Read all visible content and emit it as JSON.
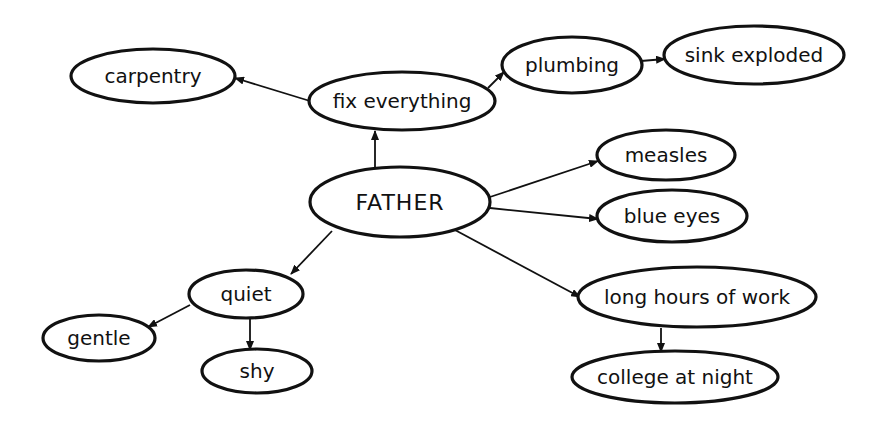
{
  "diagram": {
    "type": "concept-map",
    "style": "hand-drawn",
    "colors": {
      "ink": "#111111",
      "background": "#ffffff",
      "node_fill": "#ffffff"
    },
    "nodes": [
      {
        "id": "father",
        "label": "FATHER",
        "cx": 400,
        "cy": 202,
        "rx": 90,
        "ry": 35,
        "font_size": 22,
        "root": true
      },
      {
        "id": "fix_everything",
        "label": "fix everything",
        "cx": 402,
        "cy": 101,
        "rx": 93,
        "ry": 29,
        "font_size": 20
      },
      {
        "id": "carpentry",
        "label": "carpentry",
        "cx": 153,
        "cy": 76,
        "rx": 82,
        "ry": 27,
        "font_size": 20
      },
      {
        "id": "plumbing",
        "label": "plumbing",
        "cx": 572,
        "cy": 65,
        "rx": 70,
        "ry": 28,
        "font_size": 20
      },
      {
        "id": "sink_exploded",
        "label": "sink exploded",
        "cx": 754,
        "cy": 55,
        "rx": 90,
        "ry": 29,
        "font_size": 20
      },
      {
        "id": "measles",
        "label": "measles",
        "cx": 666,
        "cy": 155,
        "rx": 69,
        "ry": 25,
        "font_size": 20
      },
      {
        "id": "blue_eyes",
        "label": "blue eyes",
        "cx": 672,
        "cy": 216,
        "rx": 75,
        "ry": 26,
        "font_size": 20
      },
      {
        "id": "long_hours",
        "label": "long hours of work",
        "cx": 697,
        "cy": 297,
        "rx": 119,
        "ry": 30,
        "font_size": 20
      },
      {
        "id": "college",
        "label": "college at night",
        "cx": 675,
        "cy": 377,
        "rx": 103,
        "ry": 26,
        "font_size": 20
      },
      {
        "id": "quiet",
        "label": "quiet",
        "cx": 246,
        "cy": 294,
        "rx": 57,
        "ry": 24,
        "font_size": 20
      },
      {
        "id": "gentle",
        "label": "gentle",
        "cx": 99,
        "cy": 338,
        "rx": 56,
        "ry": 23,
        "font_size": 20
      },
      {
        "id": "shy",
        "label": "shy",
        "cx": 257,
        "cy": 371,
        "rx": 55,
        "ry": 22,
        "font_size": 20
      }
    ],
    "edges": [
      {
        "from": "father",
        "to": "fix_everything",
        "x1": 375,
        "y1": 167,
        "x2": 375,
        "y2": 131
      },
      {
        "from": "fix_everything",
        "to": "carpentry",
        "x1": 310,
        "y1": 101,
        "x2": 235,
        "y2": 78
      },
      {
        "from": "fix_everything",
        "to": "plumbing",
        "x1": 488,
        "y1": 88,
        "x2": 504,
        "y2": 72
      },
      {
        "from": "plumbing",
        "to": "sink_exploded",
        "x1": 641,
        "y1": 61,
        "x2": 665,
        "y2": 59
      },
      {
        "from": "father",
        "to": "measles",
        "x1": 490,
        "y1": 197,
        "x2": 598,
        "y2": 161
      },
      {
        "from": "father",
        "to": "blue_eyes",
        "x1": 490,
        "y1": 208,
        "x2": 598,
        "y2": 219
      },
      {
        "from": "father",
        "to": "long_hours",
        "x1": 455,
        "y1": 230,
        "x2": 580,
        "y2": 297
      },
      {
        "from": "long_hours",
        "to": "college",
        "x1": 661,
        "y1": 328,
        "x2": 661,
        "y2": 352
      },
      {
        "from": "father",
        "to": "quiet",
        "x1": 332,
        "y1": 231,
        "x2": 291,
        "y2": 274
      },
      {
        "from": "quiet",
        "to": "gentle",
        "x1": 190,
        "y1": 305,
        "x2": 148,
        "y2": 327
      },
      {
        "from": "quiet",
        "to": "shy",
        "x1": 250,
        "y1": 318,
        "x2": 250,
        "y2": 350
      }
    ]
  }
}
